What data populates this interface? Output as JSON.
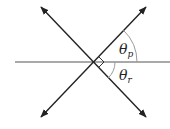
{
  "diagram": {
    "type": "angle-diagram",
    "center": [
      93,
      62
    ],
    "lines": [
      {
        "name": "horizontal-line",
        "from": [
          15,
          62
        ],
        "to": [
          170,
          62
        ]
      },
      {
        "name": "line-upper-left-to-lower-right",
        "from": [
          41,
          7
        ],
        "to": [
          146,
          117
        ],
        "arrows": "both"
      },
      {
        "name": "line-lower-left-to-upper-right",
        "from": [
          41,
          117
        ],
        "to": [
          146,
          7
        ],
        "arrows": "both"
      }
    ],
    "right_angle_marker": true,
    "labels": {
      "theta_p": {
        "symbol": "θ",
        "subscript": "p"
      },
      "theta_r": {
        "symbol": "θ",
        "subscript": "r"
      }
    },
    "colors": {
      "line": "#222222",
      "arc": "#9a9a9a",
      "text": "#222222"
    }
  }
}
